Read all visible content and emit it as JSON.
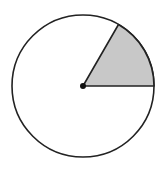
{
  "diagram": {
    "type": "circle-sector",
    "circle": {
      "cx": 83,
      "cy": 86,
      "r": 71,
      "stroke": "#222222",
      "fill": "#ffffff"
    },
    "sector": {
      "start_angle_deg": 0,
      "end_angle_deg": 60,
      "fill": "#c8c8c8",
      "stroke": "#222222"
    },
    "center_point": {
      "fill": "#111111",
      "r": 3
    }
  }
}
